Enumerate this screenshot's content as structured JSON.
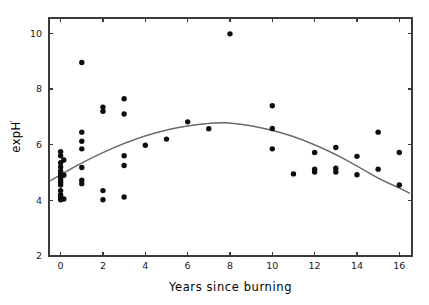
{
  "chart_data": {
    "type": "scatter",
    "title": "",
    "xlabel": "Years since burning",
    "ylabel": "expH",
    "ylabel_superscript": "'",
    "xlim": [
      -0.55,
      16.6
    ],
    "ylim": [
      2,
      10.55
    ],
    "xticks": [
      0,
      2,
      4,
      6,
      8,
      10,
      12,
      14,
      16
    ],
    "xticklabels": [
      "0",
      "2",
      "4",
      "6",
      "8",
      "10",
      "12",
      "14",
      "16"
    ],
    "yticks": [
      2,
      4,
      6,
      8,
      10
    ],
    "yticklabels": [
      "2",
      "4",
      "6",
      "8",
      "10"
    ],
    "grid": false,
    "legend": null,
    "marker": "filled-circle",
    "marker_color": "#0d0d0d",
    "curve_color": "#8a8a8a",
    "points": [
      {
        "x": 0,
        "y": 5.75
      },
      {
        "x": 0,
        "y": 5.6
      },
      {
        "x": 0,
        "y": 5.35
      },
      {
        "x": 0,
        "y": 5.2
      },
      {
        "x": 0,
        "y": 5.05
      },
      {
        "x": 0,
        "y": 4.95
      },
      {
        "x": 0,
        "y": 4.85
      },
      {
        "x": 0,
        "y": 4.75
      },
      {
        "x": 0,
        "y": 4.65
      },
      {
        "x": 0,
        "y": 4.55
      },
      {
        "x": 0,
        "y": 4.35
      },
      {
        "x": 0,
        "y": 4.2
      },
      {
        "x": 0,
        "y": 4.1
      },
      {
        "x": 0,
        "y": 4.02
      },
      {
        "x": 0.15,
        "y": 5.45
      },
      {
        "x": 0.15,
        "y": 4.9
      },
      {
        "x": 0.15,
        "y": 4.05
      },
      {
        "x": 1,
        "y": 8.95
      },
      {
        "x": 1,
        "y": 6.45
      },
      {
        "x": 1,
        "y": 6.12
      },
      {
        "x": 1,
        "y": 5.85
      },
      {
        "x": 1,
        "y": 5.18
      },
      {
        "x": 1,
        "y": 4.72
      },
      {
        "x": 1,
        "y": 4.6
      },
      {
        "x": 2,
        "y": 7.35
      },
      {
        "x": 2,
        "y": 7.2
      },
      {
        "x": 2,
        "y": 4.35
      },
      {
        "x": 2,
        "y": 4.02
      },
      {
        "x": 3,
        "y": 7.65
      },
      {
        "x": 3,
        "y": 7.1
      },
      {
        "x": 3,
        "y": 5.6
      },
      {
        "x": 3,
        "y": 5.25
      },
      {
        "x": 3,
        "y": 4.12
      },
      {
        "x": 4,
        "y": 5.98
      },
      {
        "x": 5,
        "y": 6.2
      },
      {
        "x": 6,
        "y": 6.82
      },
      {
        "x": 7,
        "y": 6.57
      },
      {
        "x": 8,
        "y": 9.98
      },
      {
        "x": 10,
        "y": 7.4
      },
      {
        "x": 10,
        "y": 6.58
      },
      {
        "x": 10,
        "y": 5.85
      },
      {
        "x": 11,
        "y": 4.95
      },
      {
        "x": 12,
        "y": 5.72
      },
      {
        "x": 12,
        "y": 5.12
      },
      {
        "x": 12,
        "y": 5.02
      },
      {
        "x": 13,
        "y": 5.9
      },
      {
        "x": 13,
        "y": 5.15
      },
      {
        "x": 13,
        "y": 5.02
      },
      {
        "x": 14,
        "y": 5.58
      },
      {
        "x": 14,
        "y": 4.92
      },
      {
        "x": 15,
        "y": 6.45
      },
      {
        "x": 15,
        "y": 5.12
      },
      {
        "x": 16,
        "y": 5.72
      },
      {
        "x": 16,
        "y": 4.55
      }
    ],
    "fit_curve": {
      "description": "quadratic regression fit",
      "type": "quadratic",
      "points": [
        {
          "x": -0.5,
          "y": 4.7
        },
        {
          "x": 0,
          "y": 4.92
        },
        {
          "x": 1,
          "y": 5.35
        },
        {
          "x": 2,
          "y": 5.72
        },
        {
          "x": 3,
          "y": 6.05
        },
        {
          "x": 4,
          "y": 6.32
        },
        {
          "x": 5,
          "y": 6.53
        },
        {
          "x": 6,
          "y": 6.68
        },
        {
          "x": 7,
          "y": 6.77
        },
        {
          "x": 7.6,
          "y": 6.79
        },
        {
          "x": 8,
          "y": 6.78
        },
        {
          "x": 9,
          "y": 6.68
        },
        {
          "x": 10,
          "y": 6.52
        },
        {
          "x": 11,
          "y": 6.3
        },
        {
          "x": 12,
          "y": 6.0
        },
        {
          "x": 13,
          "y": 5.65
        },
        {
          "x": 14,
          "y": 5.24
        },
        {
          "x": 15,
          "y": 4.78
        },
        {
          "x": 16,
          "y": 4.45
        },
        {
          "x": 16.5,
          "y": 4.25
        }
      ]
    }
  }
}
